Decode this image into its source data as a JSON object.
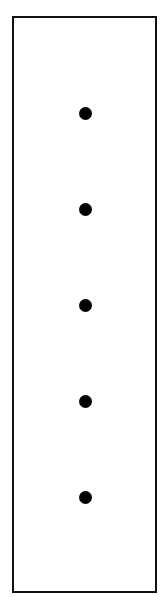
{
  "diagram": {
    "frame": {
      "stroke_color": "#111111",
      "fill_color": "#ffffff"
    },
    "dots": [
      {
        "x": 85,
        "y": 113,
        "color": "#000000"
      },
      {
        "x": 85,
        "y": 209,
        "color": "#000000"
      },
      {
        "x": 85,
        "y": 305,
        "color": "#000000"
      },
      {
        "x": 85,
        "y": 401,
        "color": "#000000"
      },
      {
        "x": 85,
        "y": 497,
        "color": "#000000"
      }
    ],
    "dot_count": 5
  }
}
